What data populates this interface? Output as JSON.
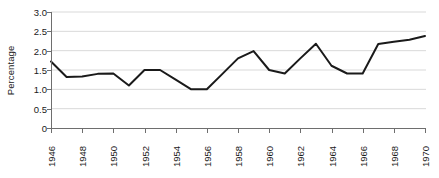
{
  "chart_data": {
    "type": "line",
    "title": "",
    "xlabel": "",
    "ylabel": "Percentage",
    "ylim": [
      0,
      3.0
    ],
    "xlim": [
      1946,
      1970
    ],
    "grid": true,
    "legend": false,
    "y_ticks": [
      "3.0",
      "2.5",
      "2.0",
      "1.5",
      "1.0",
      "0.5",
      "0"
    ],
    "y_tick_values": [
      3.0,
      2.5,
      2.0,
      1.5,
      1.0,
      0.5,
      0
    ],
    "x_tick_labels": [
      "1946",
      "1948",
      "1950",
      "1952",
      "1954",
      "1956",
      "1958",
      "1960",
      "1962",
      "1964",
      "1966",
      "1968",
      "1970"
    ],
    "x_tick_values": [
      1946,
      1948,
      1950,
      1952,
      1954,
      1956,
      1958,
      1960,
      1962,
      1964,
      1966,
      1968,
      1970
    ],
    "x": [
      1946,
      1947,
      1948,
      1949,
      1950,
      1951,
      1952,
      1953,
      1954,
      1955,
      1956,
      1957,
      1958,
      1959,
      1960,
      1961,
      1962,
      1963,
      1964,
      1965,
      1966,
      1967,
      1968,
      1969,
      1970
    ],
    "values": [
      1.72,
      1.32,
      1.33,
      1.4,
      1.41,
      1.1,
      1.5,
      1.5,
      1.25,
      1.0,
      1.0,
      1.4,
      1.8,
      1.99,
      1.5,
      1.41,
      1.8,
      2.18,
      1.61,
      1.41,
      1.41,
      2.17,
      2.23,
      2.28,
      2.38
    ],
    "series_name": "Percentage",
    "line_color": "#1a1a1a",
    "line_width": 2.0,
    "grid_color": "#d9d9d9",
    "axis_color": "#6e6e6e",
    "background": "#ffffff"
  }
}
